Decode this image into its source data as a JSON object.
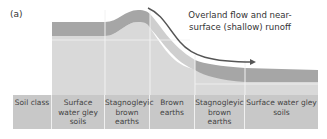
{
  "panel": {
    "label": "(a)"
  },
  "annotation": {
    "runoff_text": "Overland flow and near-surface (shallow) runoff",
    "arrow_icon": "curved-arrow-right"
  },
  "colors": {
    "topsoil_band": "#a6a6a6",
    "subsoil": "#d9d9d9",
    "table_bg": "#c8c8c8",
    "divider": "#f2f2f2",
    "arrow": "#555555"
  },
  "soil_table": {
    "columns": [
      {
        "label": "Soil class",
        "width": 39
      },
      {
        "label": "Surface water gley soils",
        "width": 53
      },
      {
        "label": "Stagnogleyic brown earths",
        "width": 45
      },
      {
        "label": "Brown earths",
        "width": 45
      },
      {
        "label": "Stagnogleyic brown earths",
        "width": 50
      },
      {
        "label": "Surface water gley soils",
        "width": 73
      }
    ]
  }
}
